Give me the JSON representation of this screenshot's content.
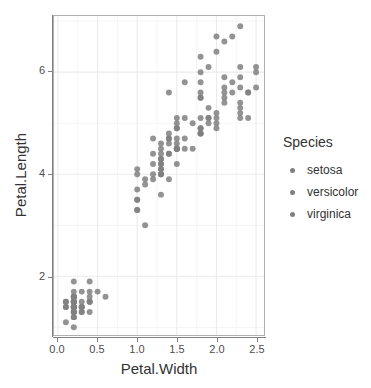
{
  "chart_data": {
    "type": "scatter",
    "title": "",
    "xlabel": "Petal.Width",
    "ylabel": "Petal.Length",
    "xlim": [
      -0.05,
      2.6
    ],
    "ylim": [
      0.85,
      7.1
    ],
    "xticks": [
      "0.0",
      "0.5",
      "1.0",
      "1.5",
      "2.0",
      "2.5"
    ],
    "xtick_values": [
      0.0,
      0.5,
      1.0,
      1.5,
      2.0,
      2.5
    ],
    "yticks": [
      "2",
      "4",
      "6"
    ],
    "ytick_values": [
      2,
      4,
      6
    ],
    "grid": true,
    "grid_minor": true,
    "legend_position": "right",
    "legend_title": "Species",
    "point_color": "#808080",
    "point_radius": 3.0,
    "panel_background": "#ffffff",
    "grid_color": "#ebebeb",
    "border_color": "#b0b0b0",
    "series": [
      {
        "name": "setosa",
        "color": "#808080",
        "x": [
          0.2,
          0.2,
          0.2,
          0.2,
          0.2,
          0.4,
          0.3,
          0.2,
          0.2,
          0.1,
          0.2,
          0.2,
          0.1,
          0.1,
          0.2,
          0.4,
          0.4,
          0.3,
          0.3,
          0.3,
          0.2,
          0.4,
          0.2,
          0.5,
          0.2,
          0.2,
          0.4,
          0.2,
          0.2,
          0.2,
          0.2,
          0.4,
          0.1,
          0.2,
          0.2,
          0.2,
          0.2,
          0.1,
          0.2,
          0.2,
          0.3,
          0.3,
          0.2,
          0.6,
          0.4,
          0.3,
          0.2,
          0.2,
          0.2,
          0.2
        ],
        "y": [
          1.4,
          1.4,
          1.3,
          1.5,
          1.4,
          1.7,
          1.4,
          1.5,
          1.4,
          1.5,
          1.5,
          1.6,
          1.4,
          1.1,
          1.2,
          1.5,
          1.3,
          1.4,
          1.7,
          1.5,
          1.7,
          1.5,
          1.0,
          1.7,
          1.9,
          1.6,
          1.6,
          1.5,
          1.4,
          1.6,
          1.6,
          1.5,
          1.5,
          1.4,
          1.5,
          1.2,
          1.3,
          1.4,
          1.3,
          1.5,
          1.3,
          1.3,
          1.3,
          1.6,
          1.9,
          1.4,
          1.6,
          1.4,
          1.5,
          1.4
        ]
      },
      {
        "name": "versicolor",
        "color": "#808080",
        "x": [
          1.4,
          1.5,
          1.5,
          1.3,
          1.5,
          1.3,
          1.6,
          1.0,
          1.3,
          1.4,
          1.0,
          1.5,
          1.0,
          1.4,
          1.3,
          1.4,
          1.5,
          1.0,
          1.5,
          1.1,
          1.8,
          1.3,
          1.5,
          1.2,
          1.3,
          1.4,
          1.4,
          1.7,
          1.5,
          1.0,
          1.1,
          1.0,
          1.2,
          1.6,
          1.5,
          1.6,
          1.5,
          1.3,
          1.3,
          1.3,
          1.2,
          1.4,
          1.2,
          1.0,
          1.3,
          1.2,
          1.3,
          1.3,
          1.1,
          1.3
        ],
        "y": [
          4.7,
          4.5,
          4.9,
          4.0,
          4.6,
          4.5,
          4.7,
          3.3,
          4.6,
          3.9,
          3.5,
          4.2,
          4.0,
          4.7,
          3.6,
          4.4,
          4.5,
          4.1,
          4.5,
          3.9,
          4.8,
          4.0,
          4.9,
          4.7,
          4.3,
          4.4,
          4.8,
          5.0,
          4.5,
          3.5,
          3.8,
          3.7,
          3.9,
          5.1,
          4.5,
          4.5,
          4.7,
          4.4,
          4.1,
          4.0,
          4.4,
          4.6,
          4.0,
          3.3,
          4.2,
          4.2,
          4.2,
          4.3,
          3.0,
          4.1
        ]
      },
      {
        "name": "virginica",
        "color": "#808080",
        "x": [
          2.5,
          1.9,
          2.1,
          1.8,
          2.2,
          2.1,
          1.7,
          1.8,
          1.8,
          2.5,
          2.0,
          1.9,
          2.1,
          2.0,
          2.4,
          2.3,
          1.8,
          2.2,
          2.3,
          1.5,
          2.3,
          2.0,
          2.0,
          1.8,
          2.1,
          1.8,
          1.8,
          1.8,
          2.1,
          1.6,
          1.9,
          2.0,
          2.2,
          1.5,
          1.4,
          2.3,
          2.4,
          1.8,
          1.8,
          2.1,
          2.4,
          2.3,
          1.9,
          2.3,
          2.5,
          2.3,
          1.9,
          2.0,
          2.3,
          1.8
        ],
        "y": [
          6.0,
          5.1,
          5.9,
          5.6,
          5.8,
          6.6,
          4.5,
          6.3,
          5.8,
          6.1,
          5.1,
          5.3,
          5.5,
          5.0,
          5.1,
          5.3,
          5.5,
          6.7,
          6.9,
          5.0,
          5.7,
          4.9,
          6.7,
          4.9,
          5.7,
          6.0,
          4.8,
          4.9,
          5.6,
          5.8,
          6.1,
          6.4,
          5.6,
          5.1,
          5.6,
          6.1,
          5.6,
          5.5,
          4.8,
          5.4,
          5.6,
          5.1,
          5.1,
          5.9,
          5.7,
          5.2,
          5.0,
          5.2,
          5.4,
          5.1
        ]
      }
    ]
  },
  "axes": {
    "x_title": "Petal.Width",
    "y_title": "Petal.Length",
    "x_tick_labels": [
      "0.0",
      "0.5",
      "1.0",
      "1.5",
      "2.0",
      "2.5"
    ],
    "y_tick_labels": [
      "6",
      "4",
      "2"
    ]
  },
  "legend": {
    "title": "Species",
    "items": [
      {
        "label": "setosa"
      },
      {
        "label": "versicolor"
      },
      {
        "label": "virginica"
      }
    ]
  }
}
